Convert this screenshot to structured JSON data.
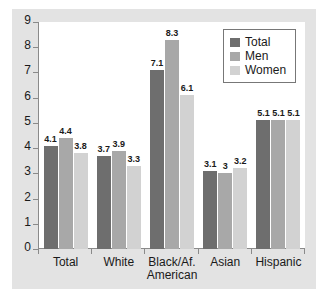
{
  "chart_data": {
    "type": "bar",
    "title": "",
    "subtitle": "",
    "xlabel": "",
    "ylabel": "",
    "ylim": [
      0,
      9
    ],
    "yticks": [
      "0",
      "1",
      "2",
      "3",
      "4",
      "5",
      "6",
      "7",
      "8",
      "9"
    ],
    "grid": false,
    "legend_position": "top-right",
    "categories": [
      "Total",
      "White",
      "Black/Af. American",
      "Asian",
      "Hispanic"
    ],
    "category_lines": [
      [
        "Total"
      ],
      [
        "White"
      ],
      [
        "Black/Af.",
        "American"
      ],
      [
        "Asian"
      ],
      [
        "Hispanic"
      ]
    ],
    "series": [
      {
        "name": "Total",
        "color": "#6e6e6e",
        "values": [
          4.1,
          3.7,
          7.1,
          3.1,
          5.1
        ],
        "labels": [
          "4.1",
          "3.7",
          "7.1",
          "3.1",
          "5.1"
        ]
      },
      {
        "name": "Men",
        "color": "#a8a8a8",
        "values": [
          4.4,
          3.9,
          8.3,
          3,
          5.1
        ],
        "labels": [
          "4.4",
          "3.9",
          "8.3",
          "3",
          "5.1"
        ]
      },
      {
        "name": "Women",
        "color": "#d2d2d2",
        "values": [
          3.8,
          3.3,
          6.1,
          3.2,
          5.1
        ],
        "labels": [
          "3.8",
          "3.3",
          "6.1",
          "3.2",
          "5.1"
        ]
      }
    ]
  },
  "legend": {
    "items": [
      {
        "label": "Total",
        "color": "#6e6e6e"
      },
      {
        "label": "Men",
        "color": "#a8a8a8"
      },
      {
        "label": "Women",
        "color": "#d2d2d2"
      }
    ]
  },
  "colors": {
    "panel_background": "#e3e3e3",
    "plot_background": "#ffffff",
    "axis": "#8a8a8a",
    "text": "#1a1a1a",
    "series_total": "#6e6e6e",
    "series_men": "#a8a8a8",
    "series_women": "#d2d2d2"
  }
}
